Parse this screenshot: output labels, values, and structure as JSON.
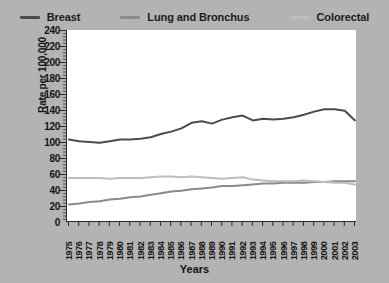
{
  "legend": {
    "position": "top",
    "items": [
      {
        "label": "Breast",
        "color": "#4b4b4b",
        "icon": "line-swatch-icon"
      },
      {
        "label": "Lung and Bronchus",
        "color": "#8a8a8a",
        "icon": "line-swatch-icon"
      },
      {
        "label": "Colorectal",
        "color": "#bdbdbd",
        "icon": "line-swatch-icon"
      }
    ]
  },
  "axes": {
    "y_title": "Rate per 100,000",
    "x_title": "Years",
    "y_ticks": [
      240,
      220,
      200,
      180,
      160,
      140,
      120,
      100,
      80,
      60,
      40,
      20,
      0
    ],
    "y_min": 0,
    "y_max": 240
  },
  "chart_data": {
    "type": "line",
    "title": "",
    "subtitle": "",
    "xlabel": "Years",
    "ylabel": "Rate per 100,000",
    "ylim": [
      0,
      240
    ],
    "ytick_step": 20,
    "grid": false,
    "legend_position": "top",
    "background": "#ffffff",
    "panel_background": "#b3b3b3",
    "x": [
      1975,
      1976,
      1977,
      1978,
      1979,
      1980,
      1981,
      1982,
      1983,
      1984,
      1985,
      1986,
      1987,
      1988,
      1989,
      1990,
      1991,
      1992,
      1993,
      1994,
      1995,
      1996,
      1997,
      1998,
      1999,
      2000,
      2001,
      2002,
      2003
    ],
    "categories": [
      "1975",
      "1976",
      "1977",
      "1978",
      "1979",
      "1980",
      "1981",
      "1982",
      "1983",
      "1984",
      "1985",
      "1986",
      "1987",
      "1988",
      "1989",
      "1990",
      "1991",
      "1992",
      "1993",
      "1994",
      "1995",
      "1996",
      "1997",
      "1998",
      "1999",
      "2000",
      "2001",
      "2002",
      "2003"
    ],
    "series": [
      {
        "name": "Breast",
        "color": "#4b4b4b",
        "values": [
          103,
          101,
          100,
          99,
          101,
          103,
          103,
          104,
          106,
          110,
          113,
          117,
          124,
          126,
          123,
          128,
          131,
          133,
          127,
          129,
          128,
          129,
          131,
          134,
          138,
          141,
          141,
          139,
          127
        ]
      },
      {
        "name": "Lung and Bronchus",
        "color": "#8a8a8a",
        "values": [
          22,
          23,
          25,
          26,
          28,
          29,
          31,
          32,
          34,
          36,
          38,
          39,
          41,
          42,
          43,
          45,
          45,
          46,
          47,
          48,
          48,
          49,
          49,
          49,
          50,
          50,
          51,
          51,
          51
        ]
      },
      {
        "name": "Colorectal",
        "color": "#bdbdbd",
        "values": [
          55,
          55,
          55,
          55,
          54,
          55,
          55,
          55,
          56,
          57,
          57,
          56,
          57,
          56,
          55,
          54,
          55,
          56,
          53,
          52,
          51,
          51,
          51,
          52,
          51,
          50,
          49,
          49,
          47
        ]
      }
    ]
  }
}
